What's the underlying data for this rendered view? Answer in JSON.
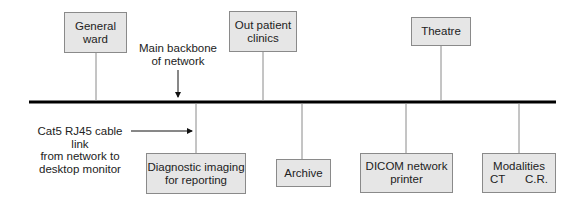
{
  "diagram": {
    "type": "network-topology",
    "backbone": {
      "label_line1": "Main backbone",
      "label_line2": "of network"
    },
    "cable_label": {
      "line1": "Cat5 RJ45 cable link",
      "line2": "from network to",
      "line3": "desktop monitor"
    },
    "top_nodes": [
      {
        "id": "general-ward",
        "line1": "General",
        "line2": "ward"
      },
      {
        "id": "out-patient-clinics",
        "line1": "Out patient",
        "line2": "clinics"
      },
      {
        "id": "theatre",
        "line1": "Theatre"
      }
    ],
    "bottom_nodes": [
      {
        "id": "diagnostic-imaging",
        "line1": "Diagnostic imaging",
        "line2": "for reporting"
      },
      {
        "id": "archive",
        "line1": "Archive"
      },
      {
        "id": "dicom-printer",
        "line1": "DICOM network",
        "line2": "printer"
      },
      {
        "id": "modalities",
        "line1": "Modalities",
        "sub_left": "CT",
        "sub_right": "C.R."
      }
    ],
    "colors": {
      "box_fill": "#e6e6e6",
      "box_border": "#8a8a8a",
      "backbone": "#000000",
      "connector": "#8a8a8a"
    }
  }
}
